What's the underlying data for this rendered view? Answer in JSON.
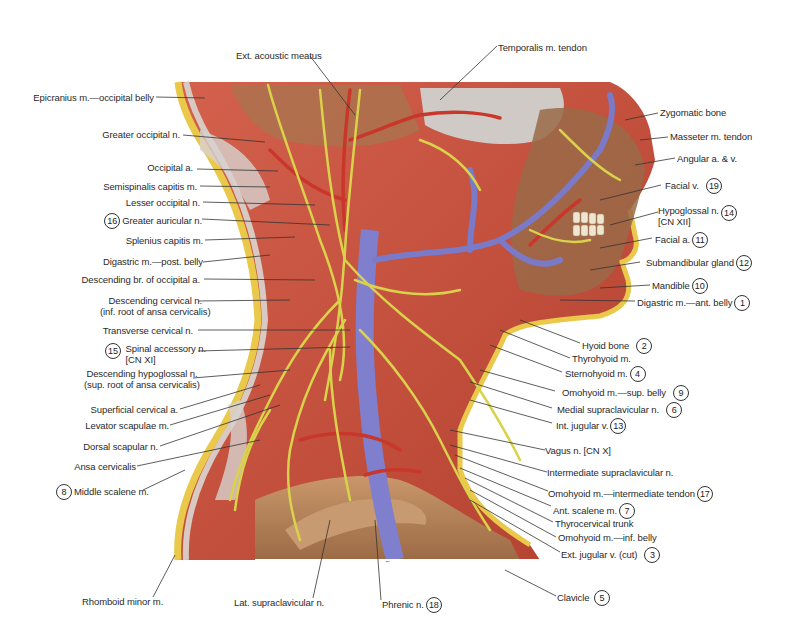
{
  "figure": {
    "colors": {
      "muscle": "#c9503f",
      "muscle_light": "#e07a66",
      "tendon": "#d9d4d0",
      "nerve": "#d8d24a",
      "vein": "#7a7ac8",
      "artery": "#c8352a",
      "bone": "#b8845a",
      "skin_fat": "#e9c84a",
      "leader_line": "#333333"
    }
  },
  "labels_top": [
    {
      "text": "Ext. acoustic meatus"
    },
    {
      "text": "Temporalis m. tendon"
    }
  ],
  "labels_left": [
    {
      "text": "Epicranius m.—occipital belly"
    },
    {
      "text": "Greater occipital n."
    },
    {
      "text": "Occipital a."
    },
    {
      "text": "Semispinalis capitis m."
    },
    {
      "text": "Lesser occipital n."
    },
    {
      "text": "Greater auricular n.",
      "number": "16"
    },
    {
      "text": "Splenius capitis m."
    },
    {
      "text": "Digastric m.—post. belly"
    },
    {
      "text": "Descending br. of occipital a."
    },
    {
      "text": "Descending cervical n.",
      "text2": "(inf. root of ansa cervicalis)"
    },
    {
      "text": "Transverse cervical n."
    },
    {
      "text": "Spinal accessory n.",
      "text2": "[CN XI]",
      "number": "15"
    },
    {
      "text": "Descending hypoglossal n.",
      "text2": "(sup. root of ansa cervicalis)"
    },
    {
      "text": "Superficial cervical a."
    },
    {
      "text": "Levator scapulae m."
    },
    {
      "text": "Dorsal scapular n."
    },
    {
      "text": "Ansa cervicalis"
    },
    {
      "text": "Middle scalene m.",
      "number": "8"
    }
  ],
  "labels_right": [
    {
      "text": "Zygomatic bone"
    },
    {
      "text": "Masseter m. tendon"
    },
    {
      "text": "Angular a. & v."
    },
    {
      "text": "Facial v.",
      "number": "19"
    },
    {
      "text": "Hypoglossal n.",
      "text2": "[CN XII]",
      "number": "14"
    },
    {
      "text": "Facial a.",
      "number": "11"
    },
    {
      "text": "Submandibular gland",
      "number": "12"
    },
    {
      "text": "Mandible",
      "number": "10"
    },
    {
      "text": "Digastric m.—ant. belly",
      "number": "1"
    },
    {
      "text": "Hyoid bone",
      "number": "2"
    },
    {
      "text": "Thyrohyoid m."
    },
    {
      "text": "Sternohyoid m.",
      "number": "4"
    },
    {
      "text": "Omohyoid m.—sup. belly",
      "number": "9"
    },
    {
      "text": "Medial supraclavicular n.",
      "number": "6"
    },
    {
      "text": "Int. jugular v.",
      "number": "13"
    },
    {
      "text": "Vagus n. [CN X]"
    },
    {
      "text": "Intermediate supraclavicular n."
    },
    {
      "text": "Omohyoid m.—intermediate tendon",
      "number": "17"
    },
    {
      "text": "Ant. scalene m.",
      "number": "7"
    },
    {
      "text": "Thyrocervical trunk"
    },
    {
      "text": "Omohyoid m.—inf. belly"
    },
    {
      "text": "Ext. jugular v. (cut)",
      "number": "3"
    },
    {
      "text": "Clavicle",
      "number": "5"
    }
  ],
  "labels_bottom": [
    {
      "text": "Rhomboid minor m."
    },
    {
      "text": "Lat. supraclavicular n."
    },
    {
      "text": "Phrenic n.",
      "number": "18"
    }
  ]
}
